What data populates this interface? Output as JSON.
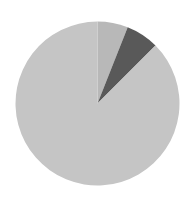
{
  "chart_data": {
    "type": "pie",
    "title": "",
    "start_angle_deg": 0,
    "direction": "clockwise",
    "center": [
      97.5,
      103.5
    ],
    "radius": 82,
    "slices": [
      {
        "label": "",
        "value": 6.0,
        "color": "#b8b8b8"
      },
      {
        "label": "",
        "value": 6.5,
        "color": "#595959"
      },
      {
        "label": "",
        "value": 87.5,
        "color": "#c5c5c5"
      }
    ],
    "legend": []
  }
}
